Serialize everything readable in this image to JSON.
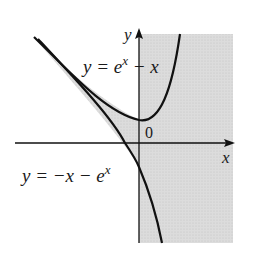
{
  "figure": {
    "upper_curve_label": {
      "base": "y = e",
      "sup": "x",
      "tail": " − x"
    },
    "lower_curve_label": {
      "base": "y = −x − e",
      "sup": "x"
    },
    "x_axis_label": "x",
    "y_axis_label": "y",
    "origin_label": "0",
    "colors": {
      "curve": "#111111",
      "shade": "#d9d9d9",
      "axis": "#111111",
      "background": "#ffffff"
    }
  }
}
